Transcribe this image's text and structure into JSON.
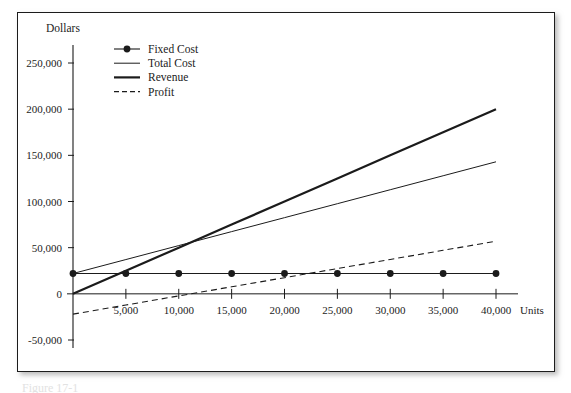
{
  "figure": {
    "caption": "Figure 17-1"
  },
  "chart_data": {
    "type": "line",
    "title": "",
    "xlabel": "Units",
    "ylabel": "Dollars",
    "xlim": [
      0,
      40000
    ],
    "ylim": [
      -50000,
      250000
    ],
    "grid": false,
    "legend_position": "top-left",
    "x": [
      0,
      5000,
      10000,
      15000,
      20000,
      25000,
      30000,
      35000,
      40000
    ],
    "xticks": [
      0,
      5000,
      10000,
      15000,
      20000,
      25000,
      30000,
      35000,
      40000
    ],
    "xtick_labels": [
      "",
      "5,000",
      "10,000",
      "15,000",
      "20,000",
      "25,000",
      "30,000",
      "35,000",
      "40,000"
    ],
    "yticks": [
      -50000,
      0,
      50000,
      100000,
      150000,
      200000,
      250000
    ],
    "ytick_labels": [
      "-50,000",
      "0",
      "50,000",
      "100,000",
      "150,000",
      "200,000",
      "250,000"
    ],
    "series": [
      {
        "name": "Fixed Cost",
        "style": "line-marker",
        "marker": "circle",
        "width": 1.1,
        "color": "#1b1b1b",
        "values": [
          22000,
          22000,
          22000,
          22000,
          22000,
          22000,
          22000,
          22000,
          22000
        ]
      },
      {
        "name": "Total Cost",
        "style": "solid-thin",
        "marker": "none",
        "width": 1.0,
        "color": "#1b1b1b",
        "values": [
          22000,
          37125,
          52250,
          67375,
          82500,
          97625,
          112750,
          127875,
          143000
        ]
      },
      {
        "name": "Revenue",
        "style": "solid-thick",
        "marker": "none",
        "width": 2.2,
        "color": "#1b1b1b",
        "values": [
          0,
          25000,
          50000,
          75000,
          100000,
          125000,
          150000,
          175000,
          200000
        ]
      },
      {
        "name": "Profit",
        "style": "dashed",
        "marker": "none",
        "width": 1.1,
        "color": "#1b1b1b",
        "values": [
          -22000,
          -12125,
          -2250,
          7625,
          17500,
          27375,
          37250,
          47125,
          57000
        ]
      }
    ]
  },
  "colors": {
    "ink": "#1b1b1b",
    "frame": "#1c1c1c",
    "background": "#ffffff"
  }
}
